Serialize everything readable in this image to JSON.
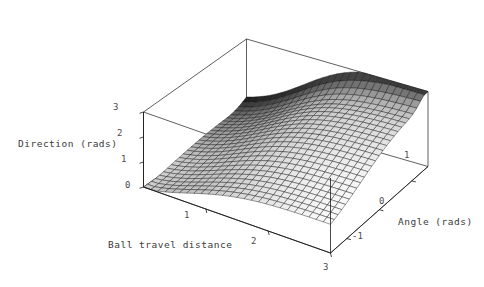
{
  "figure": {
    "kind": "surface-plot-3d",
    "background": "#ffffff",
    "line_color": "#1a1a1a",
    "text_color": "#3a3a3a"
  },
  "axes": {
    "z": {
      "label": "Direction (rads)",
      "ticks": [
        "3",
        "2",
        "1",
        "0"
      ],
      "tick_values": [
        3,
        2,
        1,
        0
      ],
      "range": [
        0,
        3
      ]
    },
    "x": {
      "label": "Ball travel distance",
      "ticks": [
        "1",
        "2",
        "3"
      ],
      "tick_values": [
        1,
        2,
        3
      ],
      "range": [
        0,
        3
      ]
    },
    "y": {
      "label": "Angle (rads)",
      "ticks": [
        "1",
        "0",
        "-1"
      ],
      "tick_values": [
        1,
        0,
        -1
      ],
      "range": [
        -1.5,
        1.5
      ]
    }
  },
  "chart_data": {
    "type": "surface",
    "title": "",
    "xlabel": "Ball travel distance",
    "ylabel": "Angle (rads)",
    "zlabel": "Direction (rads)",
    "xlim": [
      0,
      3
    ],
    "ylim": [
      -1.5,
      1.5
    ],
    "zlim": [
      0,
      3
    ],
    "grid": true,
    "legend": "none",
    "mesh": {
      "nx": 26,
      "ny": 26,
      "wireframe": true,
      "shaded": true
    },
    "shading": {
      "plateau_fill": "#e2e2e2",
      "mid_fill": "#b4b4b4",
      "valley_fill": "#3b3b3b",
      "back_ridge_fill": "#242424"
    },
    "x": [
      0,
      0.6,
      1.2,
      1.8,
      2.4,
      3.0
    ],
    "y": [
      -1.5,
      -0.9,
      -0.3,
      0.3,
      0.9,
      1.5
    ],
    "z_grid": [
      [
        0.02,
        0.18,
        0.55,
        1.1,
        1.7,
        2.25
      ],
      [
        0.1,
        0.4,
        0.95,
        1.55,
        2.0,
        2.45
      ],
      [
        0.28,
        0.78,
        1.4,
        1.9,
        2.2,
        2.58
      ],
      [
        0.55,
        1.2,
        1.75,
        2.08,
        2.32,
        2.66
      ],
      [
        0.9,
        1.55,
        1.98,
        2.2,
        2.42,
        2.74
      ],
      [
        1.25,
        1.8,
        2.12,
        2.32,
        2.52,
        2.82
      ]
    ]
  },
  "labels": {
    "z_axis": "Direction (rads)",
    "x_axis": "Ball travel distance",
    "y_axis": "Angle (rads)"
  },
  "ticks": {
    "z": [
      {
        "text": "3",
        "x": 113,
        "y": 102
      },
      {
        "text": "2",
        "x": 117,
        "y": 128
      },
      {
        "text": "1",
        "x": 121,
        "y": 154
      },
      {
        "text": "0",
        "x": 125,
        "y": 180
      }
    ],
    "x": [
      {
        "text": "1",
        "x": 184,
        "y": 210
      },
      {
        "text": "2",
        "x": 251,
        "y": 236
      },
      {
        "text": "3",
        "x": 323,
        "y": 262
      }
    ],
    "y": [
      {
        "text": "1",
        "x": 404,
        "y": 150
      },
      {
        "text": "0",
        "x": 379,
        "y": 196
      },
      {
        "text": "-1",
        "x": 352,
        "y": 231
      }
    ]
  }
}
